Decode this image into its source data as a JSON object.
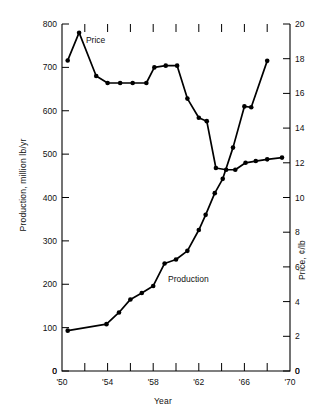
{
  "chart_data": {
    "type": "line",
    "title": "",
    "xlabel": "Year",
    "ylabel": "Production, million lb/yr",
    "ylabel_secondary": "Price, ¢/lb",
    "xlim": [
      1950,
      1970
    ],
    "ylim": [
      0,
      800
    ],
    "ylim_secondary": [
      0,
      20
    ],
    "grid": false,
    "legend": "inline-annotations",
    "x_tick_labels": [
      "'50",
      "'54",
      "'58",
      "'62",
      "'66",
      "'70"
    ],
    "x_tick_values": [
      1950,
      1954,
      1958,
      1962,
      1966,
      1970
    ],
    "x_minor_tick_values": [
      1952,
      1956,
      1960,
      1964,
      1968
    ],
    "y_tick_labels": [
      "0",
      "100",
      "200",
      "300",
      "400",
      "500",
      "600",
      "700",
      "800"
    ],
    "y_tick_values": [
      0,
      100,
      200,
      300,
      400,
      500,
      600,
      700,
      800
    ],
    "y2_tick_labels": [
      "0",
      "2",
      "4",
      "6",
      "8",
      "10",
      "12",
      "14",
      "16",
      "18",
      "20"
    ],
    "y2_tick_values": [
      0,
      2,
      4,
      6,
      8,
      10,
      12,
      14,
      16,
      18,
      20
    ],
    "series": [
      {
        "name": "Production",
        "axis": "left",
        "units": "million lb/yr",
        "annotation": "Production",
        "annotation_x": 1959.3,
        "annotation_y": 205,
        "points": [
          {
            "x": 1950.5,
            "y": 93
          },
          {
            "x": 1953.9,
            "y": 108
          },
          {
            "x": 1955.0,
            "y": 135
          },
          {
            "x": 1956.0,
            "y": 165
          },
          {
            "x": 1957.0,
            "y": 180
          },
          {
            "x": 1958.0,
            "y": 196
          },
          {
            "x": 1959.0,
            "y": 248
          },
          {
            "x": 1960.0,
            "y": 257
          },
          {
            "x": 1961.0,
            "y": 277
          },
          {
            "x": 1962.0,
            "y": 325
          },
          {
            "x": 1962.6,
            "y": 360
          },
          {
            "x": 1963.4,
            "y": 410
          },
          {
            "x": 1964.1,
            "y": 443
          },
          {
            "x": 1965.0,
            "y": 515
          },
          {
            "x": 1966.0,
            "y": 610
          },
          {
            "x": 1966.6,
            "y": 608
          },
          {
            "x": 1968.0,
            "y": 715
          }
        ]
      },
      {
        "name": "Price",
        "axis": "right",
        "units": "¢/lb",
        "annotation": "Price",
        "annotation_x": 1952.1,
        "annotation_y": 18.9,
        "points": [
          {
            "x": 1950.5,
            "y": 17.9
          },
          {
            "x": 1951.5,
            "y": 19.5
          },
          {
            "x": 1953.0,
            "y": 17.0
          },
          {
            "x": 1954.0,
            "y": 16.6
          },
          {
            "x": 1955.1,
            "y": 16.6
          },
          {
            "x": 1956.2,
            "y": 16.6
          },
          {
            "x": 1957.4,
            "y": 16.6
          },
          {
            "x": 1958.1,
            "y": 17.5
          },
          {
            "x": 1959.1,
            "y": 17.6
          },
          {
            "x": 1960.1,
            "y": 17.6
          },
          {
            "x": 1961.0,
            "y": 15.7
          },
          {
            "x": 1962.0,
            "y": 14.6
          },
          {
            "x": 1962.7,
            "y": 14.4
          },
          {
            "x": 1963.5,
            "y": 11.7
          },
          {
            "x": 1964.4,
            "y": 11.6
          },
          {
            "x": 1965.2,
            "y": 11.6
          },
          {
            "x": 1966.1,
            "y": 12.0
          },
          {
            "x": 1967.0,
            "y": 12.1
          },
          {
            "x": 1968.0,
            "y": 12.2
          },
          {
            "x": 1969.3,
            "y": 12.3
          }
        ]
      }
    ]
  }
}
